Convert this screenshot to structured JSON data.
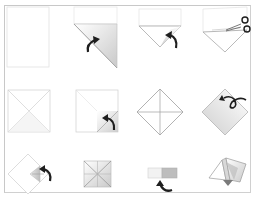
{
  "diagram": {
    "title": "",
    "colors": {
      "paper": "#ffffff",
      "paper_shade": "#d9d9d9",
      "outline": "#c4c4c4",
      "crease": "#9a9a9a",
      "arrow": "#1e1e1e",
      "frame": "#c8c8c8"
    },
    "steps": [
      {
        "index": 1,
        "name": "blank-square-sheet",
        "icon": "none"
      },
      {
        "index": 2,
        "name": "fold-corner-diagonal",
        "icon": "curved-arrow-icon"
      },
      {
        "index": 3,
        "name": "folded-triangle-flip",
        "icon": "curved-arrow-icon"
      },
      {
        "index": 4,
        "name": "cut-off-strip",
        "icon": "scissors-icon"
      },
      {
        "index": 5,
        "name": "square-with-diagonal-creases",
        "icon": "none"
      },
      {
        "index": 6,
        "name": "fold-corner-to-center",
        "icon": "curved-arrow-icon"
      },
      {
        "index": 7,
        "name": "diamond-with-creases",
        "icon": "none"
      },
      {
        "index": 8,
        "name": "turn-over-diamond",
        "icon": "loop-arrow-icon"
      },
      {
        "index": 9,
        "name": "fold-corners-again",
        "icon": "curved-arrow-icon"
      },
      {
        "index": 10,
        "name": "small-square-with-creases",
        "icon": "none"
      },
      {
        "index": 11,
        "name": "fold-in-half",
        "icon": "curved-arrow-icon"
      },
      {
        "index": 12,
        "name": "finished-fortune-teller",
        "icon": "none"
      }
    ]
  }
}
